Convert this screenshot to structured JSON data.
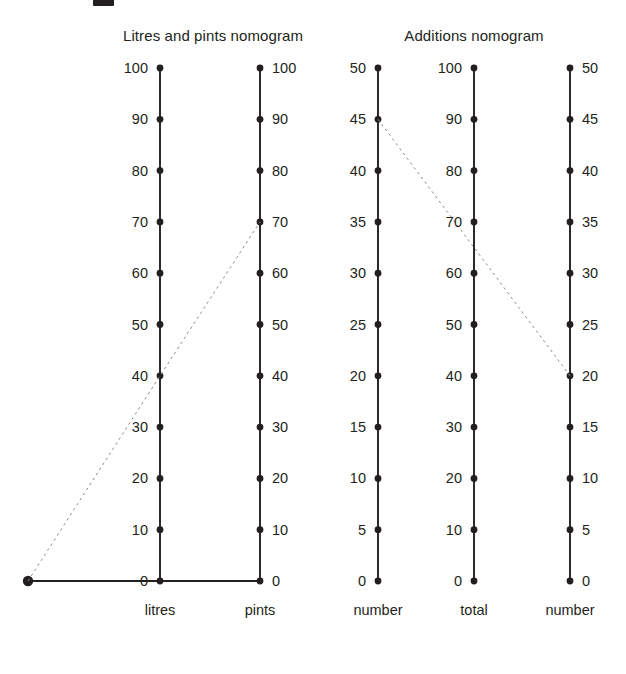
{
  "figure": {
    "background_color": "#ffffff",
    "ink_color": "#231f20",
    "guide_color": "#8d8d8d",
    "cropped_heading_visible": true
  },
  "nomograms": [
    {
      "id": "litres-pints",
      "title": "Litres and pints nomogram",
      "title_x": 213,
      "title_y": 35,
      "axes": [
        {
          "id": "litres",
          "caption": "litres",
          "x": 160,
          "label_side": "left",
          "min": 0,
          "max": 100,
          "step": 10,
          "ticks": [
            "0",
            "10",
            "20",
            "30",
            "40",
            "50",
            "60",
            "70",
            "80",
            "90",
            "100"
          ]
        },
        {
          "id": "pints",
          "caption": "pints",
          "x": 260,
          "label_side": "right",
          "min": 0,
          "max": 100,
          "step": 10,
          "ticks": [
            "0",
            "10",
            "20",
            "30",
            "40",
            "50",
            "60",
            "70",
            "80",
            "90",
            "100"
          ]
        }
      ],
      "pivot": {
        "x": 28,
        "y": 581,
        "label": ""
      },
      "baseline": {
        "from_x": 28,
        "to_x": 260,
        "y": 581
      },
      "guide_line": {
        "style": "dashed",
        "from": {
          "axis": "pivot",
          "x": 28,
          "y": 581
        },
        "via": {
          "axis": "litres",
          "value": 40
        },
        "to": {
          "axis": "pints",
          "value": 70
        }
      }
    },
    {
      "id": "additions",
      "title": "Additions nomogram",
      "title_x": 474,
      "title_y": 35,
      "axes": [
        {
          "id": "number-left",
          "caption": "number",
          "x": 378,
          "label_side": "left",
          "min": 0,
          "max": 50,
          "step": 5,
          "ticks": [
            "0",
            "5",
            "10",
            "15",
            "20",
            "25",
            "30",
            "35",
            "40",
            "45",
            "50"
          ]
        },
        {
          "id": "total",
          "caption": "total",
          "x": 474,
          "label_side": "left",
          "min": 0,
          "max": 100,
          "step": 10,
          "ticks": [
            "0",
            "10",
            "20",
            "30",
            "40",
            "50",
            "60",
            "70",
            "80",
            "90",
            "100"
          ]
        },
        {
          "id": "number-right",
          "caption": "number",
          "x": 570,
          "label_side": "right",
          "min": 0,
          "max": 50,
          "step": 5,
          "ticks": [
            "0",
            "5",
            "10",
            "15",
            "20",
            "25",
            "30",
            "35",
            "40",
            "45",
            "50"
          ]
        }
      ],
      "guide_line": {
        "style": "dashed",
        "from": {
          "axis": "number-left",
          "value": 45
        },
        "via": {
          "axis": "total",
          "value": 65
        },
        "to": {
          "axis": "number-right",
          "value": 20
        }
      }
    }
  ],
  "geometry": {
    "axis_top_y": 68,
    "axis_bottom_y": 581,
    "caption_y": 610,
    "tick_dot_radius": 3.4,
    "axis_stroke_width": 1.9,
    "guide_stroke_width": 1.0,
    "label_gap": 12
  },
  "chart_data": {
    "type": "line",
    "series": [
      {
        "name": "Litres and pints guide line",
        "points": [
          {
            "axis": "pivot",
            "value": null
          },
          {
            "axis": "litres",
            "value": 40
          },
          {
            "axis": "pints",
            "value": 70
          }
        ]
      },
      {
        "name": "Additions guide line",
        "points": [
          {
            "axis": "number-left",
            "value": 45
          },
          {
            "axis": "total",
            "value": 65
          },
          {
            "axis": "number-right",
            "value": 20
          }
        ]
      }
    ],
    "xlabel": "",
    "ylabel": "",
    "grid": false,
    "legend": "none"
  }
}
